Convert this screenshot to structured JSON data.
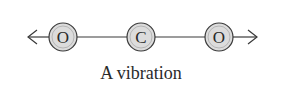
{
  "diagram": {
    "caption": "A vibration",
    "atoms": [
      {
        "label": "O",
        "cx": 63,
        "cy": 37
      },
      {
        "label": "C",
        "cx": 141,
        "cy": 37
      },
      {
        "label": "O",
        "cx": 219,
        "cy": 37
      }
    ],
    "arrows": [
      {
        "direction": "left"
      },
      {
        "direction": "right"
      }
    ],
    "colors": {
      "atom_fill": "#dcdcdc",
      "stroke": "#3a3a3a",
      "text": "#2a2a2a"
    }
  }
}
